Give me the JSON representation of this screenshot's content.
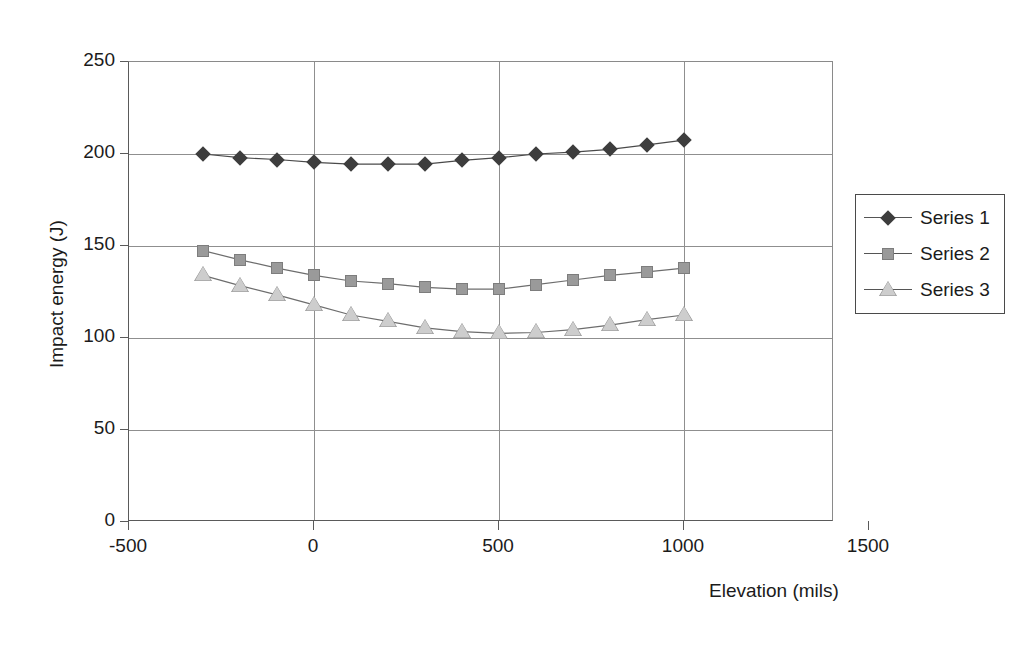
{
  "chart_data": {
    "type": "line",
    "title": "",
    "xlabel": "Elevation (mils)",
    "ylabel": "Impact energy (J)",
    "xlim": [
      -500,
      1500
    ],
    "ylim": [
      0,
      250
    ],
    "xticks": [
      -500,
      0,
      500,
      1000,
      1500
    ],
    "yticks": [
      0,
      50,
      100,
      150,
      200,
      250
    ],
    "xtick_labels": [
      "-500",
      "0",
      "500",
      "1000",
      "1500"
    ],
    "ytick_labels": [
      "0",
      "50",
      "100",
      "150",
      "200",
      "250"
    ],
    "grid": "horizontal-and-vertical-major",
    "legend_position": "right",
    "x": [
      -300,
      -200,
      -100,
      0,
      100,
      200,
      300,
      400,
      500,
      600,
      700,
      800,
      900,
      1000
    ],
    "series": [
      {
        "name": "Series 1",
        "marker": "diamond",
        "color": "#3d3d3d",
        "values": [
          200,
          198,
          197,
          195.5,
          194.5,
          194.5,
          194.5,
          196.5,
          198,
          200,
          201,
          202.5,
          205,
          207.5
        ]
      },
      {
        "name": "Series 2",
        "marker": "square",
        "color": "#9a9a9a",
        "values": [
          147.5,
          142.5,
          138,
          134,
          131,
          129.5,
          127.5,
          126.5,
          126.5,
          129,
          131.5,
          134,
          136,
          138
        ]
      },
      {
        "name": "Series 3",
        "marker": "triangle",
        "color": "#cdcdcd",
        "values": [
          134,
          128.5,
          123.5,
          118,
          112.5,
          109,
          105.5,
          103.5,
          102.5,
          103,
          104.5,
          107,
          110,
          112.5
        ]
      }
    ]
  },
  "legend": {
    "entries": [
      {
        "label": "Series 1"
      },
      {
        "label": "Series 2"
      },
      {
        "label": "Series 3"
      }
    ]
  }
}
